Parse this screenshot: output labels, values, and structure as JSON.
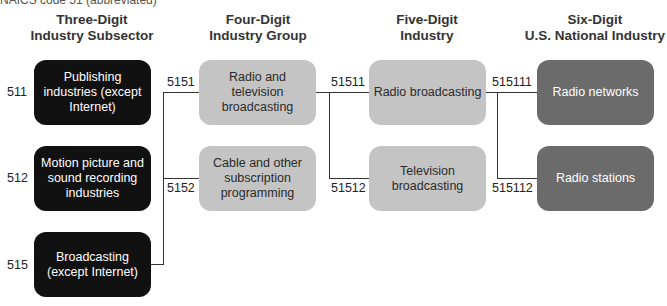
{
  "caption": "NAICS code 51 (abbreviated)",
  "columns": [
    {
      "line1": "Three-Digit",
      "line2": "Industry Subsector"
    },
    {
      "line1": "Four-Digit",
      "line2": "Industry Group"
    },
    {
      "line1": "Five-Digit",
      "line2": "Industry"
    },
    {
      "line1": "Six-Digit",
      "line2": "U.S. National Industry"
    }
  ],
  "subsectors": [
    {
      "code": "511",
      "label": "Publishing industries (except Internet)"
    },
    {
      "code": "512",
      "label": "Motion picture and sound recording industries"
    },
    {
      "code": "515",
      "label": "Broadcasting (except Internet)"
    }
  ],
  "groups": [
    {
      "code": "5151",
      "label": "Radio and television broadcasting"
    },
    {
      "code": "5152",
      "label": "Cable and other subscription programming"
    }
  ],
  "industries": [
    {
      "code": "51511",
      "label": "Radio broadcasting"
    },
    {
      "code": "51512",
      "label": "Television broadcasting"
    }
  ],
  "national_industries": [
    {
      "code": "515111",
      "label": "Radio networks"
    },
    {
      "code": "515112",
      "label": "Radio stations"
    }
  ],
  "colors": {
    "subsector_fill": "#111111",
    "group_fill": "#c4c4c4",
    "industry_fill": "#c4c4c4",
    "national_fill": "#6b6b6b",
    "connector": "#333333"
  }
}
